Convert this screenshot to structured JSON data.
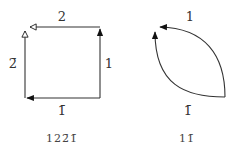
{
  "diagrams": [
    {
      "id": "square",
      "shape": "square",
      "edges": [
        {
          "position": "top",
          "label": "2",
          "direction": "right-to-left",
          "arrowhead": "open"
        },
        {
          "position": "left",
          "label": "2̄",
          "direction": "bottom-to-top",
          "arrowhead": "open"
        },
        {
          "position": "right",
          "label": "1",
          "direction": "bottom-to-top",
          "arrowhead": "filled"
        },
        {
          "position": "bottom",
          "label": "1̄",
          "direction": "right-to-left",
          "arrowhead": "filled"
        }
      ],
      "caption": "122̄1̄"
    },
    {
      "id": "lens",
      "shape": "lens",
      "edges": [
        {
          "position": "top",
          "label": "1",
          "direction": "right-to-left",
          "arrowhead": "filled"
        },
        {
          "position": "bottom",
          "label": "1̄",
          "direction": "bottom-to-top",
          "arrowhead": "filled"
        }
      ],
      "caption": "11̄"
    }
  ],
  "colors": {
    "stroke": "#222222",
    "text": "#333333",
    "background": "#ffffff"
  }
}
